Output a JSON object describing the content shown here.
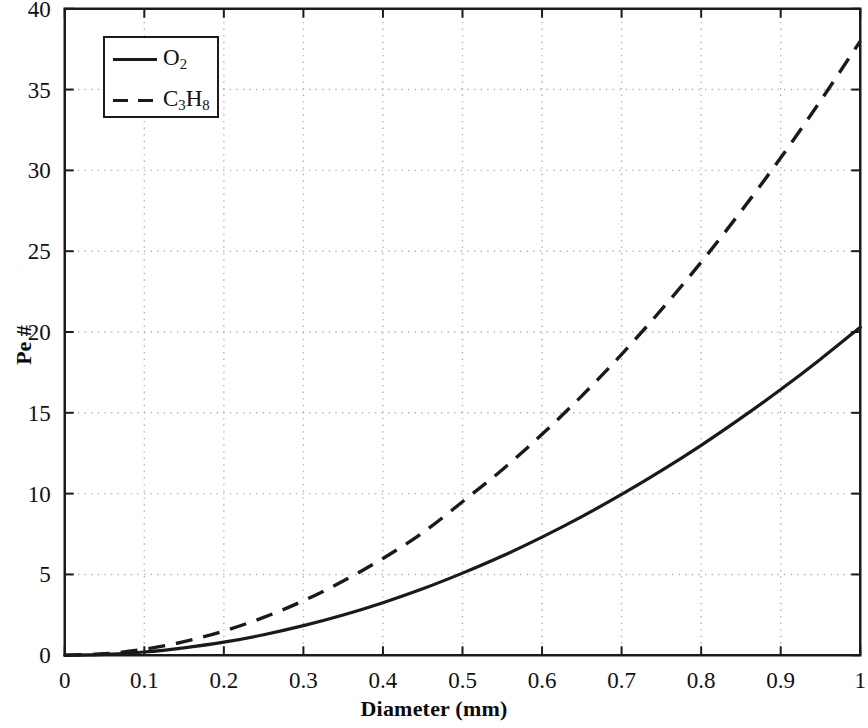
{
  "chart_data": {
    "type": "line",
    "title": "",
    "xlabel": "Diameter (mm)",
    "ylabel": "Pe #",
    "xlim": [
      0,
      1
    ],
    "ylim": [
      0,
      40
    ],
    "grid": true,
    "grid_style": "dotted",
    "legend_position": "top-left-inside",
    "xticks": [
      0,
      0.1,
      0.2,
      0.3,
      0.4,
      0.5,
      0.6,
      0.7,
      0.8,
      0.9,
      1
    ],
    "xtick_labels": [
      "0",
      "0.1",
      "0.2",
      "0.3",
      "0.4",
      "0.5",
      "0.6",
      "0.7",
      "0.8",
      "0.9",
      "1"
    ],
    "yticks": [
      0,
      5,
      10,
      15,
      20,
      25,
      30,
      35,
      40
    ],
    "ytick_labels": [
      "0",
      "5",
      "10",
      "15",
      "20",
      "25",
      "30",
      "35",
      "40"
    ],
    "x": [
      0,
      0.05,
      0.1,
      0.15,
      0.2,
      0.25,
      0.3,
      0.35,
      0.4,
      0.45,
      0.5,
      0.55,
      0.6,
      0.65,
      0.7,
      0.75,
      0.8,
      0.85,
      0.9,
      0.95,
      1
    ],
    "series": [
      {
        "name": "O2",
        "name_formula": {
          "element": "O",
          "subscript": "2"
        },
        "style": "solid",
        "color": "#1a1a1a",
        "values": [
          0,
          0.05,
          0.2,
          0.46,
          0.81,
          1.27,
          1.83,
          2.49,
          3.25,
          4.11,
          5.08,
          6.14,
          7.31,
          8.58,
          9.95,
          11.42,
          12.99,
          14.67,
          16.44,
          18.32,
          20.3
        ]
      },
      {
        "name": "C3H8",
        "name_formula": {
          "element_1": "C",
          "subscript_1": "3",
          "element_2": "H",
          "subscript_2": "8"
        },
        "style": "dashed",
        "color": "#1a1a1a",
        "values": [
          0,
          0.09,
          0.37,
          0.84,
          1.5,
          2.34,
          3.37,
          4.59,
          5.99,
          7.58,
          9.5,
          11.48,
          13.67,
          16.05,
          18.62,
          21.38,
          24.32,
          27.46,
          30.78,
          34.3,
          38.0
        ]
      }
    ],
    "legend_entries": [
      "O2",
      "C3H8"
    ],
    "annotations": []
  },
  "axes": {
    "x_title": "Diameter (mm)",
    "y_title": "Pe #",
    "x_tick_labels": [
      "0",
      "0.1",
      "0.2",
      "0.3",
      "0.4",
      "0.5",
      "0.6",
      "0.7",
      "0.8",
      "0.9",
      "1"
    ],
    "y_tick_labels": [
      "0",
      "5",
      "10",
      "15",
      "20",
      "25",
      "30",
      "35",
      "40"
    ]
  },
  "legend": {
    "entries": [
      {
        "label_main": "O",
        "label_sub": "2",
        "style": "solid"
      },
      {
        "label_main_1": "C",
        "label_sub_1": "3",
        "label_main_2": "H",
        "label_sub_2": "8",
        "style": "dashed"
      }
    ]
  },
  "colors": {
    "axis": "#1a1a1a",
    "grid": "#b4b4b4",
    "curve": "#1a1a1a",
    "background": "#ffffff"
  }
}
